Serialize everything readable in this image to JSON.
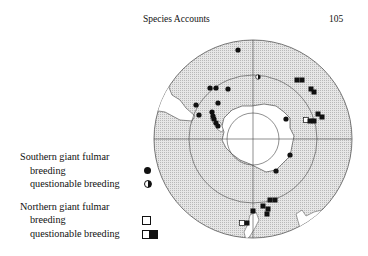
{
  "page": {
    "running_head": "Species Accounts",
    "page_number": "105"
  },
  "legend": {
    "southern": {
      "title": "Southern giant fulmar",
      "breeding": "breeding",
      "questionable": "questionable breeding"
    },
    "northern": {
      "title": "Northern giant fulmar",
      "breeding": "breeding",
      "questionable": "questionable breeding"
    }
  },
  "map": {
    "projection": "south-polar",
    "center": [
      253,
      139
    ],
    "outer_radius": 99,
    "mid_radius": 64,
    "pole_radius": 26,
    "colors": {
      "ocean_hatch": "#c8c8c8",
      "land": "#ffffff",
      "line": "#333333",
      "marker": "#111111"
    },
    "markers": [
      {
        "type": "southern-breeding",
        "x": 238,
        "y": 50
      },
      {
        "type": "southern-questionable",
        "x": 258,
        "y": 77
      },
      {
        "type": "southern-breeding",
        "x": 210,
        "y": 88
      },
      {
        "type": "southern-breeding",
        "x": 216,
        "y": 88
      },
      {
        "type": "southern-breeding",
        "x": 228,
        "y": 89
      },
      {
        "type": "southern-breeding",
        "x": 196,
        "y": 105
      },
      {
        "type": "southern-breeding",
        "x": 218,
        "y": 103
      },
      {
        "type": "southern-breeding",
        "x": 199,
        "y": 115
      },
      {
        "type": "southern-breeding",
        "x": 212,
        "y": 112
      },
      {
        "type": "southern-breeding",
        "x": 213,
        "y": 116
      },
      {
        "type": "southern-breeding",
        "x": 214,
        "y": 119
      },
      {
        "type": "southern-breeding",
        "x": 216,
        "y": 123
      },
      {
        "type": "southern-breeding",
        "x": 218,
        "y": 126
      },
      {
        "type": "southern-breeding",
        "x": 286,
        "y": 119
      },
      {
        "type": "southern-breeding",
        "x": 290,
        "y": 155
      },
      {
        "type": "southern-breeding",
        "x": 276,
        "y": 171
      },
      {
        "type": "northern-breeding-filled",
        "x": 297,
        "y": 80
      },
      {
        "type": "northern-breeding-filled",
        "x": 302,
        "y": 80
      },
      {
        "type": "northern-breeding-filled",
        "x": 311,
        "y": 89
      },
      {
        "type": "northern-breeding-filled",
        "x": 314,
        "y": 92
      },
      {
        "type": "northern-breeding-filled",
        "x": 318,
        "y": 114
      },
      {
        "type": "northern-breeding-filled",
        "x": 322,
        "y": 117
      },
      {
        "type": "northern-breeding",
        "x": 306,
        "y": 120
      },
      {
        "type": "northern-breeding-filled",
        "x": 310,
        "y": 121
      },
      {
        "type": "northern-breeding-filled",
        "x": 314,
        "y": 121
      },
      {
        "type": "northern-breeding-filled",
        "x": 270,
        "y": 200
      },
      {
        "type": "northern-breeding-filled",
        "x": 275,
        "y": 200
      },
      {
        "type": "northern-breeding-filled",
        "x": 263,
        "y": 206
      },
      {
        "type": "northern-breeding-filled",
        "x": 268,
        "y": 209
      },
      {
        "type": "northern-breeding-filled",
        "x": 267,
        "y": 214
      },
      {
        "type": "northern-breeding-filled",
        "x": 253,
        "y": 211
      },
      {
        "type": "northern-breeding",
        "x": 242,
        "y": 223
      },
      {
        "type": "northern-breeding-filled",
        "x": 247,
        "y": 223
      }
    ]
  }
}
